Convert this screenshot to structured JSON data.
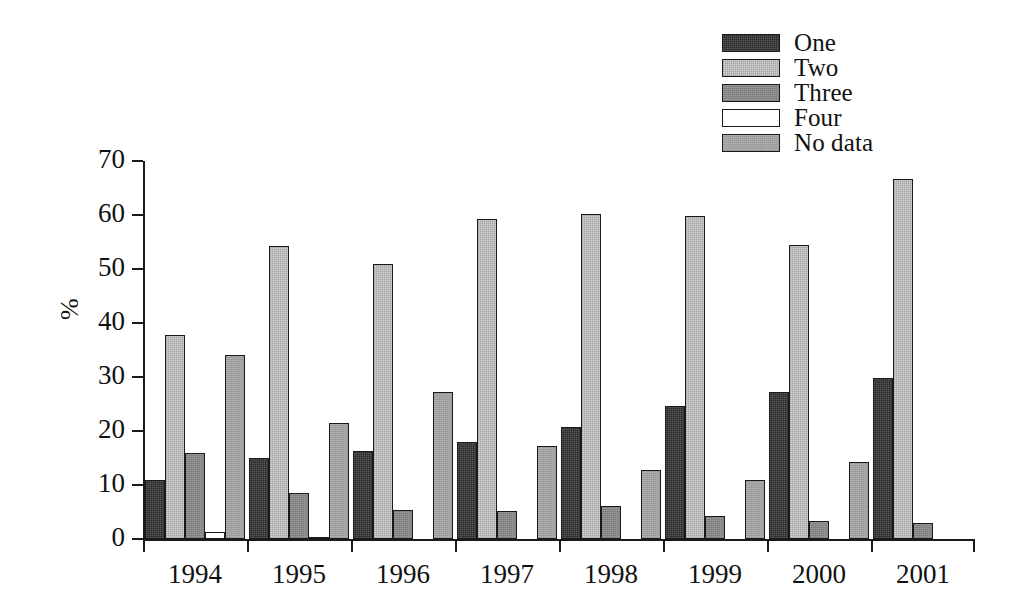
{
  "chart_data": {
    "type": "bar",
    "title": "",
    "subtitle": "",
    "xlabel": "",
    "ylabel": "%",
    "ylim": [
      0,
      70
    ],
    "yticks": [
      0,
      10,
      20,
      30,
      40,
      50,
      60,
      70
    ],
    "grid": false,
    "legend_position": "top-right",
    "categories": [
      "1994",
      "1995",
      "1996",
      "1997",
      "1998",
      "1999",
      "2000",
      "2001"
    ],
    "series": [
      {
        "name": "One",
        "color": "#2a2a2a",
        "values": [
          11.0,
          15.0,
          16.3,
          18.0,
          20.7,
          24.7,
          27.2,
          29.9
        ]
      },
      {
        "name": "Two",
        "color": "#cfcfcf",
        "values": [
          37.8,
          54.2,
          50.9,
          59.2,
          60.2,
          59.8,
          54.4,
          66.6
        ]
      },
      {
        "name": "Three",
        "color": "#8e8e8e",
        "values": [
          15.9,
          8.5,
          5.3,
          5.1,
          6.1,
          4.2,
          3.4,
          2.9
        ]
      },
      {
        "name": "Four",
        "color": "#ffffff",
        "values": [
          1.3,
          0.4,
          null,
          null,
          null,
          null,
          null,
          null
        ]
      },
      {
        "name": "No data",
        "color": "#a8a8a8",
        "values": [
          34.1,
          21.5,
          27.2,
          17.3,
          12.7,
          11.0,
          14.2,
          null
        ]
      }
    ]
  },
  "legend": {
    "items": [
      {
        "label": "One",
        "swatch": "swatch-one"
      },
      {
        "label": "Two",
        "swatch": "swatch-two"
      },
      {
        "label": "Three",
        "swatch": "swatch-three"
      },
      {
        "label": "Four",
        "swatch": "swatch-four"
      },
      {
        "label": "No data",
        "swatch": "swatch-no-data"
      }
    ]
  },
  "axes": {
    "y_label": "%",
    "y_tick_labels": [
      "0",
      "10",
      "20",
      "30",
      "40",
      "50",
      "60",
      "70"
    ],
    "x_tick_labels": [
      "1994",
      "1995",
      "1996",
      "1997",
      "1998",
      "1999",
      "2000",
      "2001"
    ]
  },
  "colors": {
    "ink": "#1a1a1a",
    "background": "#ffffff",
    "series_one": "#2a2a2a",
    "series_two": "#cfcfcf",
    "series_three": "#8e8e8e",
    "series_four": "#ffffff",
    "series_no_data": "#a8a8a8"
  }
}
